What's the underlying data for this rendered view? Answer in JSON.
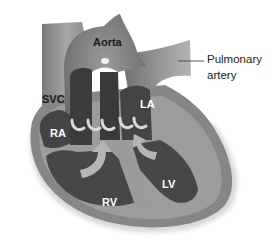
{
  "diagram": {
    "labels": {
      "aorta": "Aorta",
      "pulmonary_artery_line1": "Pulmonary",
      "pulmonary_artery_line2": "artery",
      "svc": "SVC",
      "la": "LA",
      "ra": "RA",
      "rv": "RV",
      "lv": "LV"
    },
    "colors": {
      "background": "#ffffff",
      "wall_outer": "#8a8a8a",
      "wall_light": "#a8a8a8",
      "chamber_dark": "#474747",
      "chamber_darker": "#3a3a3a",
      "valve_light": "#d8d8d8",
      "arrow_fill": "#b5b5b5",
      "leader_line": "#555555"
    }
  }
}
